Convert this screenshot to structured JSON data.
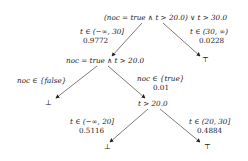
{
  "nodes": {
    "root": {
      "label": "(noc = true ∧ t > 20.0) ∨ t > 30.0"
    },
    "n1": {
      "label": "noc = true ∧ t > 20.0"
    },
    "n2": {
      "label": "t > 20.0"
    },
    "leaf_root_right": {
      "label": "⊤"
    },
    "leaf_n1_left": {
      "label": "⊥"
    },
    "leaf_n2_left": {
      "label": "⊥"
    },
    "leaf_n2_right": {
      "label": "⊤"
    }
  },
  "edges": {
    "root_left": {
      "condition": "t ∈ (−∞, 30]",
      "prob": "0.9772"
    },
    "root_right": {
      "condition": "t ∈ (30, ∞)",
      "prob": "0.0228"
    },
    "n1_left": {
      "condition": "noc ∈ {false}",
      "prob": ""
    },
    "n1_right": {
      "condition": "noc ∈ {true}",
      "prob": "0.01"
    },
    "n2_left": {
      "condition": "t ∈ (−∞, 20]",
      "prob": "0.5116"
    },
    "n2_right": {
      "condition": "t ∈ (20, 30]",
      "prob": "0.4884"
    }
  },
  "colors": {
    "edge": "#333333",
    "text": "#222222"
  }
}
